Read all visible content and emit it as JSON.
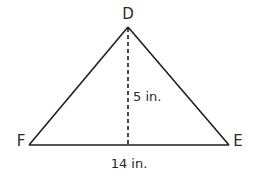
{
  "diagram": {
    "type": "triangle",
    "vertices": {
      "D": {
        "label": "D",
        "x": 128,
        "y": 27
      },
      "F": {
        "label": "F",
        "x": 29,
        "y": 145
      },
      "E": {
        "label": "E",
        "x": 229,
        "y": 145
      }
    },
    "altitude": {
      "from": "D",
      "to_base_x": 128,
      "label": "5 in.",
      "style": "dashed"
    },
    "base": {
      "from": "F",
      "to": "E",
      "label": "14 in."
    },
    "colors": {
      "stroke": "#1f1f1f",
      "text": "#2a2a2a",
      "background": "#ffffff"
    }
  }
}
